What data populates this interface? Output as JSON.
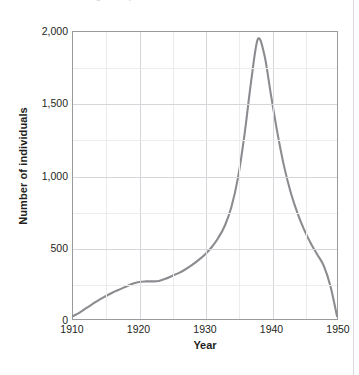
{
  "figure": {
    "top_caption_faint": "Figure  Population of individuals over time",
    "axis_line_color": "#9a9a9e",
    "grid_color": "#d6d6da",
    "minor_grid_color": "#ececed",
    "curve_color": "#8c8c90"
  },
  "chart_data": {
    "type": "line",
    "title": "",
    "xlabel": "Year",
    "ylabel": "Number of individuals",
    "xlim": [
      1910,
      1950
    ],
    "ylim": [
      0,
      2000
    ],
    "xticks": [
      1910,
      1920,
      1930,
      1940,
      1950
    ],
    "xticklabels": [
      "1910",
      "1920",
      "1930",
      "1940",
      "1950"
    ],
    "yticks": [
      0,
      500,
      1000,
      1500,
      2000
    ],
    "yticklabels": [
      "0",
      "500",
      "1,000",
      "1,500",
      "2,000"
    ],
    "y_minor_ticks": [
      250,
      750,
      1250,
      1750
    ],
    "x_minor_ticks": [
      1915,
      1925,
      1935,
      1945
    ],
    "grid": true,
    "legend": null,
    "series": [
      {
        "name": "Number of individuals",
        "color": "#8c8c90",
        "x": [
          1910,
          1911,
          1912,
          1913,
          1914,
          1915,
          1916,
          1917,
          1918,
          1919,
          1920,
          1921,
          1922,
          1923,
          1924,
          1925,
          1926,
          1927,
          1928,
          1929,
          1930,
          1931,
          1932,
          1933,
          1934,
          1935,
          1936,
          1937,
          1938,
          1939,
          1940,
          1941,
          1942,
          1943,
          1944,
          1945,
          1946,
          1947,
          1948,
          1949,
          1950
        ],
        "y": [
          20,
          45,
          75,
          105,
          135,
          160,
          185,
          205,
          225,
          245,
          258,
          262,
          262,
          265,
          280,
          300,
          320,
          345,
          375,
          410,
          450,
          500,
          565,
          650,
          780,
          985,
          1290,
          1660,
          1950,
          1840,
          1560,
          1290,
          1060,
          880,
          740,
          625,
          530,
          450,
          370,
          230,
          20
        ]
      }
    ]
  }
}
